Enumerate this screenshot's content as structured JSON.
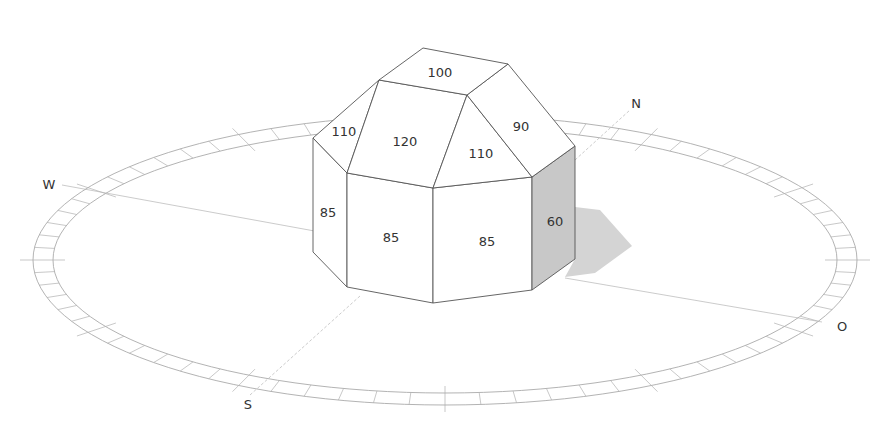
{
  "diagram": {
    "type": "solar-irradiation-building-model",
    "compass": {
      "north": "N",
      "south": "S",
      "west": "W",
      "east": "O"
    },
    "faces": {
      "roof_top": "100",
      "roof_north_west": "110",
      "roof_south": "120",
      "roof_south_east": "110",
      "roof_east": "90",
      "wall_west": "85",
      "wall_south_west": "85",
      "wall_south_east": "85",
      "wall_east_shaded": "60"
    },
    "colors": {
      "outline": "#555555",
      "shaded_face": "#c8c8c8",
      "shadow": "#d4d4d4",
      "compass_ring": "#9a9a9a",
      "axis_line": "#b5b5b5"
    }
  }
}
